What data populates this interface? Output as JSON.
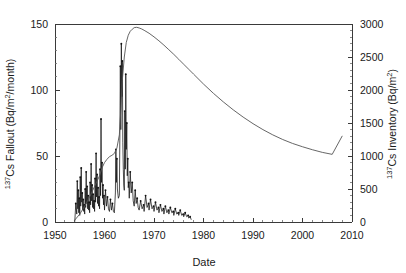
{
  "chart_data": {
    "type": "line",
    "title": "",
    "xlabel": "Date",
    "ylabel": "137Cs Fallout (Bq/m2/month)",
    "ylabel_right": "137Cs Inventory (Bq/m2)",
    "xlim": [
      1950,
      2010
    ],
    "ylim": [
      0,
      150
    ],
    "ylim_right": [
      0,
      3000
    ],
    "grid": false,
    "legend": "none",
    "xticks": [
      1950,
      1960,
      1970,
      1980,
      1990,
      2000,
      2010
    ],
    "xtick_labels": [
      "1950",
      "1960",
      "1970",
      "1980",
      "1990",
      "2000",
      "2010"
    ],
    "yticks_left": [
      0,
      50,
      100,
      150
    ],
    "ytick_labels_left": [
      "0",
      "50",
      "100",
      "150"
    ],
    "yticks_right": [
      0,
      500,
      1000,
      1500,
      2000,
      2500,
      3000
    ],
    "ytick_labels_right": [
      "0",
      "500",
      "1000",
      "1500",
      "2000",
      "2500",
      "3000"
    ],
    "y_minor_step_left": 10,
    "y_minor_step_right": 100,
    "x_minor_step": 2,
    "axis_label_superscripts": {
      "left_prefix": "137",
      "left_main": "Cs Fallout (Bq/m",
      "left_exp": "2",
      "left_suffix": "/month)",
      "right_prefix": "137",
      "right_main": "Cs Inventory (Bq/m",
      "right_exp": "2",
      "right_suffix": ")"
    },
    "series": [
      {
        "name": "137Cs Fallout",
        "axis": "left",
        "units": "Bq/m2/month",
        "style": "spiky-line-with-markers",
        "color": "#111111",
        "x": [
          1954.0,
          1954.2,
          1954.4,
          1954.5,
          1954.6,
          1954.7,
          1954.8,
          1954.9,
          1955.0,
          1955.1,
          1955.2,
          1955.3,
          1955.4,
          1955.5,
          1955.6,
          1955.7,
          1955.8,
          1955.9,
          1956.0,
          1956.1,
          1956.2,
          1956.3,
          1956.4,
          1956.5,
          1956.6,
          1956.7,
          1956.8,
          1956.9,
          1957.0,
          1957.1,
          1957.2,
          1957.3,
          1957.4,
          1957.5,
          1957.6,
          1957.7,
          1957.8,
          1957.9,
          1958.0,
          1958.1,
          1958.2,
          1958.3,
          1958.4,
          1958.5,
          1958.6,
          1958.7,
          1958.8,
          1958.9,
          1959.0,
          1959.1,
          1959.2,
          1959.3,
          1959.4,
          1959.5,
          1959.6,
          1959.7,
          1959.8,
          1959.9,
          1960.0,
          1960.2,
          1960.4,
          1960.6,
          1960.8,
          1961.0,
          1961.2,
          1961.4,
          1961.6,
          1961.8,
          1962.0,
          1962.2,
          1962.3,
          1962.4,
          1962.5,
          1962.6,
          1962.8,
          1963.0,
          1963.1,
          1963.2,
          1963.3,
          1963.4,
          1963.5,
          1963.6,
          1963.7,
          1963.8,
          1963.9,
          1964.0,
          1964.1,
          1964.2,
          1964.3,
          1964.4,
          1964.5,
          1964.6,
          1964.7,
          1964.8,
          1964.9,
          1965.0,
          1965.2,
          1965.4,
          1965.6,
          1965.8,
          1966.0,
          1966.2,
          1966.4,
          1966.6,
          1966.8,
          1967.0,
          1967.3,
          1967.6,
          1967.9,
          1968.0,
          1968.3,
          1968.6,
          1968.9,
          1969.0,
          1969.3,
          1969.6,
          1969.9,
          1970.0,
          1970.3,
          1970.6,
          1970.9,
          1971.0,
          1971.3,
          1971.6,
          1971.9,
          1972.0,
          1972.3,
          1972.6,
          1972.9,
          1973.0,
          1973.3,
          1973.6,
          1973.9,
          1974.0,
          1974.3,
          1974.6,
          1974.9,
          1975.0,
          1975.3,
          1975.6,
          1975.9,
          1976.0,
          1976.3,
          1976.6,
          1976.9,
          1977.0,
          1977.3,
          1977.5
        ],
        "y": [
          0.5,
          14,
          6,
          31,
          10,
          24,
          7,
          18,
          5,
          34,
          12,
          41,
          15,
          22,
          9,
          17,
          8,
          13,
          6,
          25,
          11,
          38,
          14,
          27,
          10,
          20,
          9,
          15,
          7,
          30,
          13,
          44,
          16,
          28,
          11,
          21,
          10,
          16,
          8,
          33,
          15,
          52,
          19,
          36,
          14,
          26,
          12,
          19,
          10,
          40,
          20,
          78,
          30,
          45,
          18,
          28,
          13,
          20,
          9,
          24,
          12,
          19,
          10,
          8,
          17,
          9,
          14,
          8,
          7,
          22,
          55,
          30,
          48,
          25,
          18,
          20,
          62,
          118,
          70,
          135,
          95,
          122,
          60,
          40,
          28,
          24,
          84,
          40,
          112,
          55,
          75,
          35,
          48,
          26,
          30,
          18,
          38,
          22,
          30,
          16,
          12,
          24,
          14,
          18,
          11,
          9,
          16,
          10,
          13,
          8,
          20,
          11,
          14,
          9,
          17,
          10,
          12,
          8,
          15,
          9,
          11,
          7,
          13,
          8,
          10,
          6,
          12,
          7,
          9,
          6,
          11,
          7,
          8,
          5,
          10,
          6,
          7,
          5,
          9,
          5,
          6,
          4,
          7,
          4,
          5,
          3,
          4,
          2
        ]
      },
      {
        "name": "137Cs Inventory",
        "axis": "right",
        "units": "Bq/m2",
        "style": "smooth-line",
        "color": "#555555",
        "x": [
          1954.0,
          1955.0,
          1956.0,
          1957.0,
          1958.0,
          1959.0,
          1959.5,
          1960.0,
          1960.5,
          1961.0,
          1961.5,
          1962.0,
          1962.5,
          1963.0,
          1963.3,
          1963.6,
          1964.0,
          1964.4,
          1964.8,
          1965.2,
          1965.6,
          1966.0,
          1966.5,
          1967.0,
          1967.5,
          1968.0,
          1969.0,
          1970.0,
          1971.0,
          1972.0,
          1973.0,
          1974.0,
          1975.0,
          1976.0,
          1977.0,
          1978.0,
          1980.0,
          1982.0,
          1984.0,
          1986.0,
          1988.0,
          1990.0,
          1992.0,
          1994.0,
          1996.0,
          1998.0,
          2000.0,
          2002.0,
          2004.0,
          2006.0,
          2008.0
        ],
        "y": [
          30,
          120,
          240,
          380,
          540,
          700,
          820,
          900,
          950,
          990,
          1010,
          1040,
          1120,
          1320,
          1700,
          2150,
          2500,
          2720,
          2830,
          2890,
          2920,
          2945,
          2950,
          2940,
          2925,
          2905,
          2860,
          2805,
          2745,
          2680,
          2610,
          2540,
          2465,
          2390,
          2315,
          2240,
          2090,
          1950,
          1820,
          1700,
          1590,
          1490,
          1400,
          1320,
          1250,
          1190,
          1140,
          1095,
          1055,
          1025,
          1300
        ]
      }
    ],
    "annotations": []
  }
}
